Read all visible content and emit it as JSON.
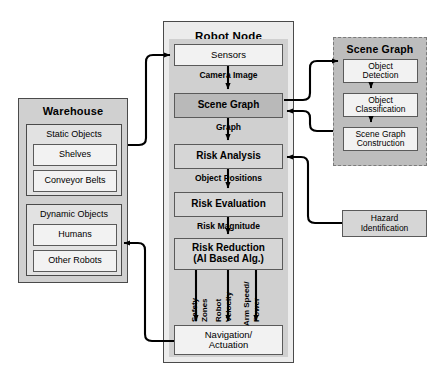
{
  "diagram": {
    "colors": {
      "outer_fill": "#d0d0d0",
      "outer_light_fill": "#ececec",
      "group_fill": "#e2e2e2",
      "node_fill": "#f2f2f2",
      "node_shaded_fill": "#d6d6d6",
      "node_dark_fill": "#b9b9b9",
      "border": "#4a4a4a",
      "wire": "#000000"
    }
  },
  "warehouse": {
    "title": "Warehouse",
    "groups": [
      {
        "header": "Static Objects",
        "items": [
          "Shelves",
          "Conveyor Belts"
        ]
      },
      {
        "header": "Dynamic Objects",
        "items": [
          "Humans",
          "Other Robots"
        ]
      }
    ]
  },
  "robot_node": {
    "title": "Robot Node",
    "nodes": [
      {
        "label": "Sensors",
        "style": "plain"
      },
      {
        "label": "Scene Graph",
        "style": "dark"
      },
      {
        "label": "Risk Analysis",
        "style": "shaded"
      },
      {
        "label": "Risk Evaluation",
        "style": "shaded"
      },
      {
        "label": "Risk Reduction\n(AI Based Alg.)",
        "style": "shaded"
      },
      {
        "label": "Navigation/\nActuation",
        "style": "plain"
      }
    ],
    "node_labels": {
      "sensors": "Sensors",
      "scene_graph": "Scene Graph",
      "risk_analysis": "Risk Analysis",
      "risk_evaluation": "Risk Evaluation",
      "risk_reduction_line1": "Risk Reduction",
      "risk_reduction_line2": "(AI Based Alg.)",
      "navigation_line1": "Navigation/",
      "navigation_line2": "Actuation"
    },
    "edge_labels": {
      "camera_image": "Camera Image",
      "graph": "Graph",
      "object_positions": "Object Positions",
      "risk_magnitude": "Risk Magnitude"
    },
    "output_labels": [
      {
        "line1": "Safety",
        "line2": "Zones"
      },
      {
        "line1": "Robot",
        "line2": "Velocity"
      },
      {
        "line1": "Arm Speed/",
        "line2": "Power"
      }
    ]
  },
  "scene_graph_subsystem": {
    "title": "Scene Graph",
    "nodes": [
      {
        "line1": "Object",
        "line2": "Detection"
      },
      {
        "line1": "Object",
        "line2": "Classification"
      },
      {
        "line1": "Scene Graph",
        "line2": "Construction"
      }
    ]
  },
  "hazard": {
    "line1": "Hazard",
    "line2": "Identification"
  }
}
